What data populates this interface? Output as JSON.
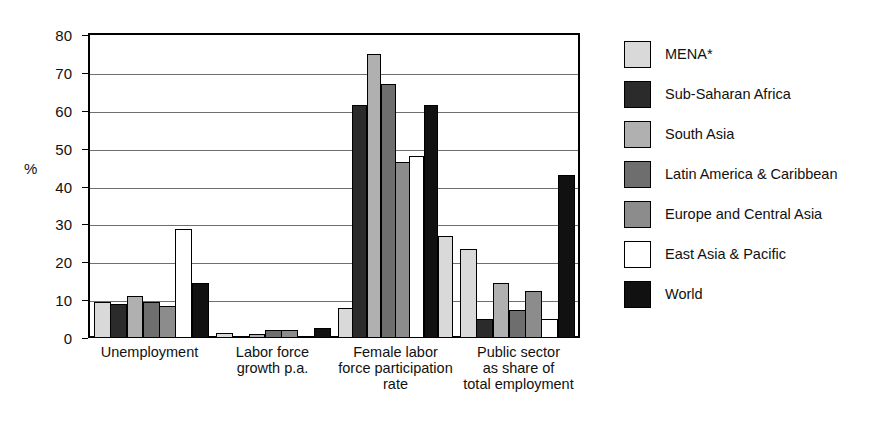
{
  "chart_data": {
    "type": "bar",
    "title": "",
    "subtitle": "",
    "xlabel": "",
    "ylabel": "%",
    "ylim": [
      0,
      80
    ],
    "yticks": [
      0,
      10,
      20,
      30,
      40,
      50,
      60,
      70,
      80
    ],
    "grid": true,
    "legend_position": "right",
    "categories": [
      "Unemployment",
      "Labor force\ngrowth p.a.",
      "Female labor\nforce participation\nrate",
      "Public sector\nas share of\ntotal employment"
    ],
    "series": [
      {
        "name": "MENA*",
        "color": "#d9d9d9",
        "values": [
          9.5,
          1.3,
          8.0,
          23.5
        ]
      },
      {
        "name": "Sub-Saharan Africa",
        "color": "#2b2b2b",
        "values": [
          9.0,
          0.6,
          61.5,
          5.0
        ]
      },
      {
        "name": "South Asia",
        "color": "#b0b0b0",
        "values": [
          11.0,
          1.0,
          75.0,
          14.5
        ]
      },
      {
        "name": "Latin America & Caribbean",
        "color": "#6e6e6e",
        "values": [
          9.5,
          2.0,
          67.0,
          7.5
        ]
      },
      {
        "name": "Europe and Central Asia",
        "color": "#8c8c8c",
        "values": [
          8.5,
          2.0,
          46.5,
          12.5
        ]
      },
      {
        "name": "East Asia & Pacific",
        "color": "#ffffff",
        "values": [
          28.8,
          0.4,
          48.0,
          5.0
        ]
      },
      {
        "name": "World",
        "color": "#111111",
        "values": [
          14.5,
          2.7,
          61.5,
          43.0
        ]
      }
    ],
    "extra_bars": [
      {
        "group": 2,
        "series": "World-extra",
        "color": "#d9d9d9",
        "value": 27.0
      }
    ]
  },
  "legend": {
    "items": [
      {
        "label": "MENA*",
        "color": "#d9d9d9"
      },
      {
        "label": "Sub-Saharan Africa",
        "color": "#2b2b2b"
      },
      {
        "label": "South Asia",
        "color": "#b0b0b0"
      },
      {
        "label": "Latin America & Caribbean",
        "color": "#6e6e6e"
      },
      {
        "label": "Europe and Central Asia",
        "color": "#8c8c8c"
      },
      {
        "label": "East Asia & Pacific",
        "color": "#ffffff"
      },
      {
        "label": "World",
        "color": "#111111"
      }
    ]
  },
  "axis": {
    "y_title": "%"
  }
}
